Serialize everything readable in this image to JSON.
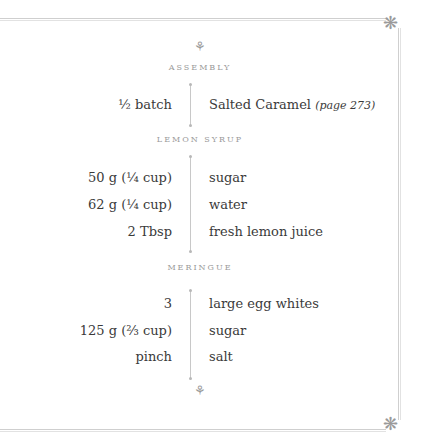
{
  "ornaments": {
    "top": "⚘",
    "bottom": "⚘",
    "corner": "❋"
  },
  "sections": [
    {
      "title": "ASSEMBLY",
      "items": [
        {
          "qty": "½ batch",
          "ingredient": "Salted Caramel",
          "ref": "(page 273)"
        }
      ]
    },
    {
      "title": "LEMON SYRUP",
      "items": [
        {
          "qty": "50 g (¼ cup)",
          "ingredient": "sugar"
        },
        {
          "qty": "62 g (¼ cup)",
          "ingredient": "water"
        },
        {
          "qty": "2 Tbsp",
          "ingredient": "fresh lemon juice"
        }
      ]
    },
    {
      "title": "MERINGUE",
      "items": [
        {
          "qty": "3",
          "ingredient": "large egg whites"
        },
        {
          "qty": "125 g (⅔ cup)",
          "ingredient": "sugar"
        },
        {
          "qty": "pinch",
          "ingredient": "salt"
        }
      ]
    }
  ]
}
